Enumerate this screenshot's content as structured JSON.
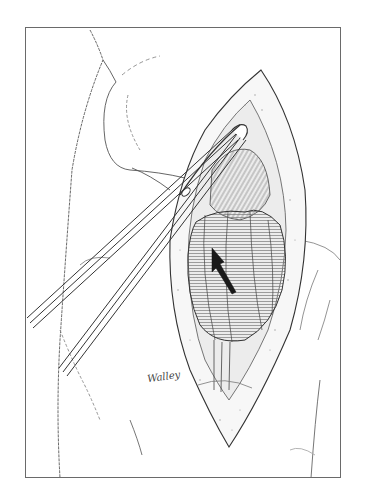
{
  "figure": {
    "type": "surgical line illustration",
    "signature": "Walley",
    "colors": {
      "background": "#ffffff",
      "line": "#3a3a3a",
      "frame": "#6a6a6a",
      "arrow": "#1a1a1a",
      "hatch": "#8a8a8a"
    },
    "frame": {
      "x": 25,
      "y": 27,
      "width": 316,
      "height": 451
    }
  }
}
